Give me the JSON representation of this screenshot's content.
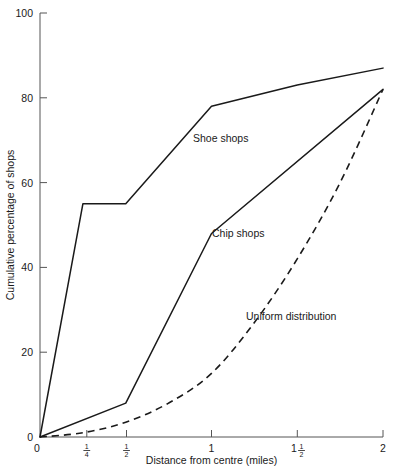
{
  "chart_data": {
    "type": "line",
    "title": "",
    "xlabel": "Distance from centre (miles)",
    "ylabel": "Cumulative percentage of shops",
    "xlim": [
      0,
      2
    ],
    "ylim": [
      0,
      100
    ],
    "grid": false,
    "legend": "inline-annotations",
    "x_ticks": [
      {
        "value": 0,
        "label": "0",
        "kind": "plain"
      },
      {
        "value": 0.25,
        "label": "1/4",
        "kind": "fraction",
        "numerator": "1",
        "denominator": "4",
        "whole": ""
      },
      {
        "value": 0.5,
        "label": "1/2",
        "kind": "fraction",
        "numerator": "1",
        "denominator": "2",
        "whole": ""
      },
      {
        "value": 1,
        "label": "1",
        "kind": "plain"
      },
      {
        "value": 1.5,
        "label": "1 1/2",
        "kind": "fraction",
        "numerator": "1",
        "denominator": "2",
        "whole": "1"
      },
      {
        "value": 2,
        "label": "2",
        "kind": "plain"
      }
    ],
    "y_ticks": [
      {
        "value": 0,
        "label": "0"
      },
      {
        "value": 20,
        "label": "20"
      },
      {
        "value": 40,
        "label": "40"
      },
      {
        "value": 60,
        "label": "60"
      },
      {
        "value": 80,
        "label": "80"
      },
      {
        "value": 100,
        "label": "100"
      }
    ],
    "series": [
      {
        "name": "Shoe shops",
        "style": "solid",
        "color": "#1a1a1a",
        "annotation": "Shoe shops",
        "annotation_at": {
          "x": 0.78,
          "y": 67
        },
        "x": [
          0,
          0.25,
          0.5,
          1,
          1.5,
          2
        ],
        "values": [
          0,
          55,
          55,
          78,
          83,
          87
        ]
      },
      {
        "name": "Chip shops",
        "style": "solid",
        "color": "#1a1a1a",
        "annotation": "Chip shops",
        "annotation_at": {
          "x": 0.9,
          "y": 47
        },
        "x": [
          0,
          0.5,
          1,
          2
        ],
        "values": [
          0,
          8,
          48,
          82
        ]
      },
      {
        "name": "Uniform distribution",
        "style": "dashed",
        "color": "#1a1a1a",
        "annotation": "Uniform distribution",
        "annotation_at": {
          "x": 1.08,
          "y": 31
        },
        "x": [
          0,
          0.25,
          0.5,
          0.75,
          1,
          1.25,
          1.5,
          1.75,
          2
        ],
        "values": [
          0,
          1,
          3.5,
          8,
          15,
          27,
          42,
          60,
          82
        ]
      }
    ]
  }
}
